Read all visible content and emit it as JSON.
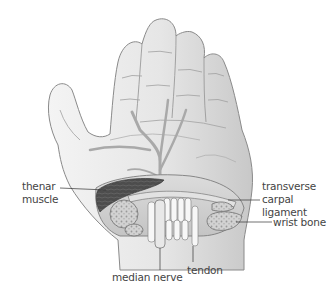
{
  "diagram": {
    "labels": {
      "thenar_muscle": [
        "thenar",
        "muscle"
      ],
      "transverse_carpal_ligament": [
        "transverse",
        "carpal",
        "ligament"
      ],
      "wrist_bone": "wrist bone",
      "median_nerve": "median nerve",
      "tendon": "tendon"
    }
  },
  "colors": {
    "background": "#ffffff",
    "skin": "#ececec",
    "skin_shadow": "#bdbdbd",
    "outline": "#8a8a8a",
    "nerve": "#a9a9a9",
    "muscle": "#4a4a4a",
    "bone": "#cfcfcf",
    "tendon": "#f7f7f7",
    "label_text": "#444444",
    "leader_line": "#333333"
  }
}
